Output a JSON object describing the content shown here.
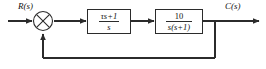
{
  "diagram": {
    "type": "control-system-block-diagram",
    "background_color": "#ffffff",
    "line_color": "#2b2b2b",
    "text_color": "#111111",
    "signals": {
      "input_label": "R(s)",
      "output_label": "C(s)"
    },
    "summing_junction": {
      "name": "summing-junction",
      "style": "circle-with-x-cross",
      "center_x": 43,
      "center_y": 21,
      "radius": 10
    },
    "blocks": [
      {
        "id": "block-1",
        "role": "controller",
        "numerator": "τs+1",
        "denominator": "s",
        "transfer_function": "(τs+1)/s"
      },
      {
        "id": "block-2",
        "role": "plant",
        "numerator": "10",
        "denominator": "s(s+1)",
        "transfer_function": "10/(s(s+1))"
      }
    ],
    "feedback": {
      "type": "unity",
      "path": "output tap to summing junction",
      "tap_x": 215,
      "bottom_y": 58
    }
  }
}
